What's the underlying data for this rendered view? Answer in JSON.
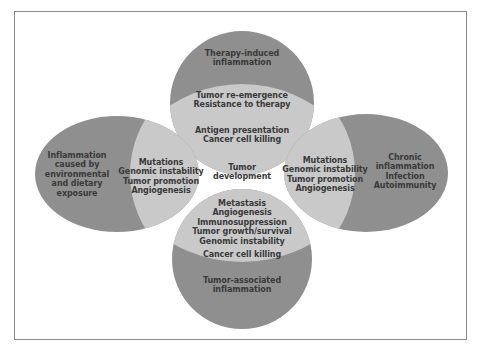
{
  "diagram": {
    "colors": {
      "outer_region": "#8f8f8f",
      "inner_region": "#c9c9c9",
      "text": "#3a3a3a",
      "frame": "#8a8a8a",
      "background": "#ffffff"
    },
    "center": {
      "lines": [
        "Tumor",
        "development"
      ]
    },
    "top": {
      "outer": {
        "lines": [
          "Therapy-induced",
          "inflammation"
        ]
      },
      "inner_upper": {
        "lines": [
          "Tumor  re-emergence",
          "Resistance to therapy"
        ]
      },
      "inner_lower": {
        "lines": [
          "Antigen presentation",
          "Cancer cell killing"
        ]
      }
    },
    "left": {
      "outer": {
        "lines": [
          "Inflammation",
          "caused by",
          "environmental",
          "and dietary",
          "exposure"
        ]
      },
      "inner": {
        "lines": [
          "Mutations",
          "Genomic instability",
          "Tumor promotion",
          "Angiogenesis"
        ]
      }
    },
    "right": {
      "outer": {
        "lines": [
          "Chronic",
          "inflammation",
          "Infection",
          "Autoimmunity"
        ]
      },
      "inner": {
        "lines": [
          "Mutations",
          "Genomic instability",
          "Tumor promotion",
          "Angiogenesis"
        ]
      }
    },
    "bottom": {
      "inner_upper": {
        "lines": [
          "Metastasis",
          "Angiogenesis",
          "Immunosuppression",
          "Tumor growth/survival",
          "Genomic instability"
        ]
      },
      "inner_lower": {
        "lines": [
          "Cancer cell killing"
        ]
      },
      "outer": {
        "lines": [
          "Tumor-associated",
          "inflammation"
        ]
      }
    }
  }
}
